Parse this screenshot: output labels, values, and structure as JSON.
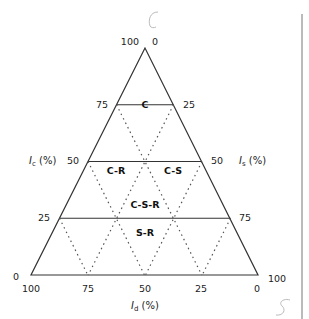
{
  "diagram": {
    "type": "ternary",
    "axes": {
      "left": {
        "symbol": "I",
        "sub": "c",
        "unit": " (%)",
        "ticks": [
          "100",
          "75",
          "50",
          "25",
          "0"
        ]
      },
      "right": {
        "symbol": "I",
        "sub": "s",
        "unit": " (%)",
        "ticks": [
          "0",
          "25",
          "50",
          "75",
          "100"
        ]
      },
      "bottom": {
        "symbol": "I",
        "sub": "d",
        "unit": " (%)",
        "ticks": [
          "100",
          "75",
          "50",
          "25",
          "0"
        ]
      }
    },
    "regions": [
      "C",
      "C-R",
      "C-S",
      "C-S-R",
      "S-R"
    ],
    "annotations": {
      "top_mark": "C",
      "bottom_mark": "S"
    }
  }
}
